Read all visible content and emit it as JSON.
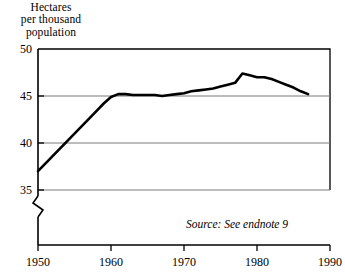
{
  "chart_data": {
    "type": "line",
    "title": "Hectares per thousand population",
    "title_lines": [
      "Hectares",
      "per thousand",
      "population"
    ],
    "xlabel": "",
    "ylabel": "Hectares per thousand population",
    "xlim": [
      1950,
      1990
    ],
    "ylim": [
      35,
      50
    ],
    "y_axis_break": true,
    "grid": true,
    "legend": false,
    "legend_position": "none",
    "yticks": [
      50,
      45,
      40,
      35
    ],
    "ytick_labels": [
      "50",
      "45",
      "40",
      "35"
    ],
    "xticks": [
      1950,
      1960,
      1970,
      1980,
      1990
    ],
    "xtick_labels": [
      "1950",
      "1960",
      "1970",
      "1980",
      "1990"
    ],
    "annotations": [
      {
        "name": "source",
        "text": "Source: See endnote 9"
      }
    ],
    "series": [
      {
        "name": "Cropland area per thousand population",
        "color": "#000000",
        "x": [
          1950,
          1951,
          1952,
          1953,
          1954,
          1955,
          1956,
          1957,
          1958,
          1959,
          1960,
          1961,
          1962,
          1963,
          1964,
          1965,
          1966,
          1967,
          1968,
          1969,
          1970,
          1971,
          1972,
          1973,
          1974,
          1975,
          1976,
          1977,
          1978,
          1979,
          1980,
          1981,
          1982,
          1983,
          1984,
          1985,
          1986,
          1987
        ],
        "values": [
          37.0,
          37.8,
          38.6,
          39.4,
          40.2,
          41.0,
          41.8,
          42.6,
          43.4,
          44.2,
          44.9,
          45.2,
          45.2,
          45.1,
          45.1,
          45.1,
          45.1,
          45.0,
          45.1,
          45.2,
          45.3,
          45.5,
          45.6,
          45.7,
          45.8,
          46.0,
          46.2,
          46.4,
          47.4,
          47.2,
          47.0,
          47.0,
          46.8,
          46.5,
          46.2,
          45.9,
          45.5,
          45.2
        ]
      }
    ]
  },
  "source": {
    "text": "Source: See endnote 9"
  }
}
